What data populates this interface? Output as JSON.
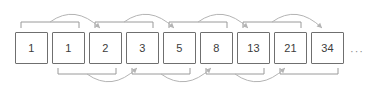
{
  "diagram": {
    "kind": "fibonacci-sequence-diagram",
    "canvas": {
      "width": 368,
      "height": 96
    },
    "colors": {
      "background": "#ffffff",
      "box_border": "#6f6f6f",
      "box_fill": "#ffffff",
      "box_text": "#3c3c3c",
      "bracket": "#9a9a9a",
      "arrow": "#b4b4b4",
      "ellipsis_text": "#8a8a8a"
    },
    "boxes": [
      {
        "value": "1",
        "x": 15,
        "y": 32,
        "w": 33,
        "h": 32
      },
      {
        "value": "1",
        "x": 52,
        "y": 32,
        "w": 33,
        "h": 32
      },
      {
        "value": "2",
        "x": 89,
        "y": 32,
        "w": 33,
        "h": 32
      },
      {
        "value": "3",
        "x": 126,
        "y": 32,
        "w": 33,
        "h": 32
      },
      {
        "value": "5",
        "x": 163,
        "y": 32,
        "w": 33,
        "h": 32
      },
      {
        "value": "8",
        "x": 200,
        "y": 32,
        "w": 33,
        "h": 32
      },
      {
        "value": "13",
        "x": 237,
        "y": 32,
        "w": 33,
        "h": 32
      },
      {
        "value": "21",
        "x": 274,
        "y": 32,
        "w": 33,
        "h": 32
      },
      {
        "value": "34",
        "x": 311,
        "y": 32,
        "w": 33,
        "h": 32
      }
    ],
    "ellipsis": {
      "text": "···",
      "x": 350,
      "y": 46
    },
    "brackets": [
      {
        "side": "top",
        "from_box": 0,
        "to_box": 1,
        "x1": 21,
        "x2": 79,
        "y": 22,
        "tick": 6
      },
      {
        "side": "bottom",
        "from_box": 1,
        "to_box": 2,
        "x1": 58,
        "x2": 116,
        "y": 74,
        "tick": 6
      },
      {
        "side": "top",
        "from_box": 2,
        "to_box": 3,
        "x1": 95,
        "x2": 153,
        "y": 22,
        "tick": 6
      },
      {
        "side": "bottom",
        "from_box": 3,
        "to_box": 4,
        "x1": 132,
        "x2": 190,
        "y": 74,
        "tick": 6
      },
      {
        "side": "top",
        "from_box": 4,
        "to_box": 5,
        "x1": 169,
        "x2": 227,
        "y": 22,
        "tick": 6
      },
      {
        "side": "bottom",
        "from_box": 5,
        "to_box": 6,
        "x1": 206,
        "x2": 264,
        "y": 74,
        "tick": 6
      },
      {
        "side": "top",
        "from_box": 6,
        "to_box": 7,
        "x1": 243,
        "x2": 301,
        "y": 22,
        "tick": 6
      },
      {
        "side": "bottom",
        "from_box": 7,
        "to_box": 8,
        "x1": 280,
        "x2": 338,
        "y": 74,
        "tick": 6
      }
    ],
    "arrows": [
      {
        "side": "top",
        "from_bracket": 0,
        "to_box": 2,
        "start_x": 50,
        "start_y": 22,
        "end_x": 100,
        "end_y": 28,
        "ctrl_x": 75,
        "ctrl_y": 4
      },
      {
        "side": "bottom",
        "from_bracket": 1,
        "to_box": 3,
        "start_x": 87,
        "start_y": 74,
        "end_x": 137,
        "end_y": 68,
        "ctrl_x": 112,
        "ctrl_y": 92
      },
      {
        "side": "top",
        "from_bracket": 2,
        "to_box": 4,
        "start_x": 124,
        "start_y": 22,
        "end_x": 174,
        "end_y": 28,
        "ctrl_x": 149,
        "ctrl_y": 4
      },
      {
        "side": "bottom",
        "from_bracket": 3,
        "to_box": 5,
        "start_x": 161,
        "start_y": 74,
        "end_x": 211,
        "end_y": 68,
        "ctrl_x": 186,
        "ctrl_y": 92
      },
      {
        "side": "top",
        "from_bracket": 4,
        "to_box": 6,
        "start_x": 198,
        "start_y": 22,
        "end_x": 248,
        "end_y": 28,
        "ctrl_x": 223,
        "ctrl_y": 4
      },
      {
        "side": "bottom",
        "from_bracket": 5,
        "to_box": 7,
        "start_x": 235,
        "start_y": 74,
        "end_x": 285,
        "end_y": 68,
        "ctrl_x": 260,
        "ctrl_y": 92
      },
      {
        "side": "top",
        "from_bracket": 6,
        "to_box": 8,
        "start_x": 272,
        "start_y": 22,
        "end_x": 322,
        "end_y": 28,
        "ctrl_x": 297,
        "ctrl_y": 4
      }
    ]
  }
}
